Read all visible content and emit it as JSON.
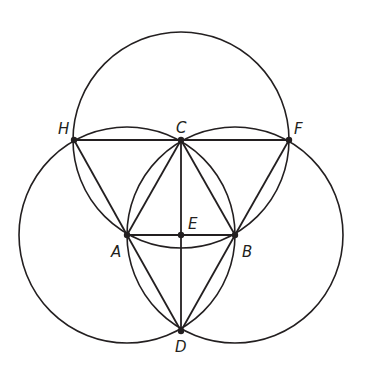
{
  "diagram": {
    "type": "geometric-construction",
    "stroke_color": "#231f20",
    "background": "#ffffff",
    "points": [
      {
        "id": "H",
        "label": "H",
        "x": 74,
        "y": 140,
        "lx": 58,
        "ly": 134
      },
      {
        "id": "C",
        "label": "C",
        "x": 181,
        "y": 140,
        "lx": 176,
        "ly": 133
      },
      {
        "id": "F",
        "label": "F",
        "x": 289,
        "y": 140,
        "lx": 294,
        "ly": 134
      },
      {
        "id": "A",
        "label": "A",
        "x": 127,
        "y": 235,
        "lx": 111,
        "ly": 257
      },
      {
        "id": "E",
        "label": "E",
        "x": 181,
        "y": 235,
        "lx": 188,
        "ly": 229
      },
      {
        "id": "B",
        "label": "B",
        "x": 235,
        "y": 235,
        "lx": 242,
        "ly": 257
      },
      {
        "id": "D",
        "label": "D",
        "x": 181,
        "y": 331,
        "lx": 175,
        "ly": 352
      }
    ],
    "circles": [
      {
        "center": "A",
        "radius": 108
      },
      {
        "center": "B",
        "radius": 108
      },
      {
        "center": "C",
        "radius": 108
      }
    ],
    "segments": [
      [
        "H",
        "C"
      ],
      [
        "C",
        "F"
      ],
      [
        "H",
        "A"
      ],
      [
        "A",
        "C"
      ],
      [
        "C",
        "B"
      ],
      [
        "B",
        "F"
      ],
      [
        "A",
        "B"
      ],
      [
        "C",
        "D"
      ],
      [
        "A",
        "D"
      ],
      [
        "B",
        "D"
      ]
    ]
  }
}
